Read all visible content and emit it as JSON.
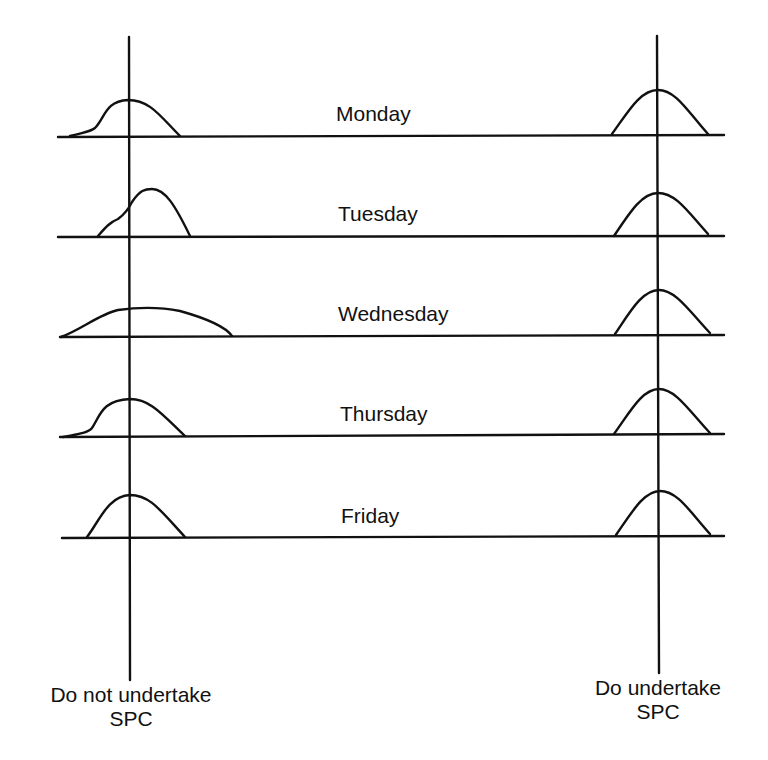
{
  "diagram": {
    "colors": {
      "stroke": "#111111",
      "background": "#ffffff"
    },
    "days": [
      {
        "label": "Monday",
        "y": 135,
        "label_x": 336,
        "label_y": 102
      },
      {
        "label": "Tuesday",
        "y": 237,
        "label_x": 338,
        "label_y": 202
      },
      {
        "label": "Wednesday",
        "y": 336,
        "label_x": 338,
        "label_y": 302
      },
      {
        "label": "Thursday",
        "y": 436,
        "label_x": 340,
        "label_y": 402
      },
      {
        "label": "Friday",
        "y": 537,
        "label_x": 341,
        "label_y": 504
      }
    ],
    "left_axis": {
      "x": 129,
      "label_line1": "Do not undertake",
      "label_line2": "SPC"
    },
    "right_axis": {
      "x": 658,
      "label_line1": "Do undertake",
      "label_line2": "SPC"
    }
  }
}
